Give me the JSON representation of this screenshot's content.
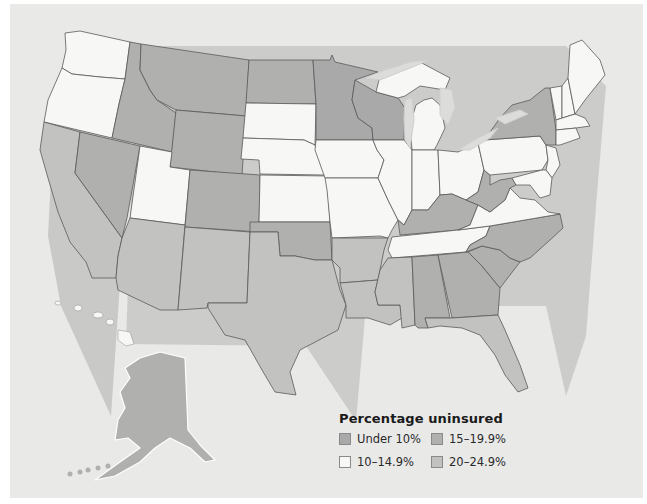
{
  "map": {
    "title": "Percentage uninsured",
    "region": "United States",
    "legend": {
      "title": "Percentage uninsured",
      "items": [
        {
          "label": "Under 10%",
          "color": "#a9a9a9"
        },
        {
          "label": "15–19.9%",
          "color": "#b0b0af"
        },
        {
          "label": "10–14.9%",
          "color": "#f7f7f6"
        },
        {
          "label": "20–24.9%",
          "color": "#c2c2c1"
        }
      ]
    },
    "states": [
      {
        "name": "Washington",
        "category": "10–14.9%"
      },
      {
        "name": "Oregon",
        "category": "10–14.9%"
      },
      {
        "name": "California",
        "category": "20–24.9%"
      },
      {
        "name": "Idaho",
        "category": "15–19.9%"
      },
      {
        "name": "Nevada",
        "category": "15–19.9%"
      },
      {
        "name": "Montana",
        "category": "15–19.9%"
      },
      {
        "name": "Wyoming",
        "category": "15–19.9%"
      },
      {
        "name": "Utah",
        "category": "10–14.9%"
      },
      {
        "name": "Colorado",
        "category": "15–19.9%"
      },
      {
        "name": "Arizona",
        "category": "20–24.9%"
      },
      {
        "name": "New Mexico",
        "category": "20–24.9%"
      },
      {
        "name": "North Dakota",
        "category": "15–19.9%"
      },
      {
        "name": "South Dakota",
        "category": "10–14.9%"
      },
      {
        "name": "Nebraska",
        "category": "10–14.9%"
      },
      {
        "name": "Kansas",
        "category": "10–14.9%"
      },
      {
        "name": "Oklahoma",
        "category": "15–19.9%"
      },
      {
        "name": "Texas",
        "category": "20–24.9%"
      },
      {
        "name": "Minnesota",
        "category": "Under 10%"
      },
      {
        "name": "Iowa",
        "category": "10–14.9%"
      },
      {
        "name": "Missouri",
        "category": "10–14.9%"
      },
      {
        "name": "Arkansas",
        "category": "20–24.9%"
      },
      {
        "name": "Louisiana",
        "category": "20–24.9%"
      },
      {
        "name": "Wisconsin",
        "category": "Under 10%"
      },
      {
        "name": "Illinois",
        "category": "10–14.9%"
      },
      {
        "name": "Michigan",
        "category": "10–14.9%"
      },
      {
        "name": "Indiana",
        "category": "10–14.9%"
      },
      {
        "name": "Ohio",
        "category": "10–14.9%"
      },
      {
        "name": "Kentucky",
        "category": "15–19.9%"
      },
      {
        "name": "Tennessee",
        "category": "10–14.9%"
      },
      {
        "name": "Mississippi",
        "category": "20–24.9%"
      },
      {
        "name": "Alabama",
        "category": "15–19.9%"
      },
      {
        "name": "Georgia",
        "category": "15–19.9%"
      },
      {
        "name": "Florida",
        "category": "20–24.9%"
      },
      {
        "name": "South Carolina",
        "category": "15–19.9%"
      },
      {
        "name": "North Carolina",
        "category": "15–19.9%"
      },
      {
        "name": "Virginia",
        "category": "10–14.9%"
      },
      {
        "name": "West Virginia",
        "category": "15–19.9%"
      },
      {
        "name": "Pennsylvania",
        "category": "10–14.9%"
      },
      {
        "name": "New York",
        "category": "15–19.9%"
      },
      {
        "name": "New Jersey",
        "category": "10–14.9%"
      },
      {
        "name": "Delaware",
        "category": "10–14.9%"
      },
      {
        "name": "Maryland",
        "category": "10–14.9%"
      },
      {
        "name": "Vermont",
        "category": "10–14.9%"
      },
      {
        "name": "New Hampshire",
        "category": "10–14.9%"
      },
      {
        "name": "Maine",
        "category": "10–14.9%"
      },
      {
        "name": "Massachusetts",
        "category": "10–14.9%"
      },
      {
        "name": "Connecticut",
        "category": "10–14.9%"
      },
      {
        "name": "Rhode Island",
        "category": "10–14.9%"
      },
      {
        "name": "Alaska",
        "category": "15–19.9%"
      },
      {
        "name": "Hawaii",
        "category": "10–14.9%"
      }
    ]
  }
}
